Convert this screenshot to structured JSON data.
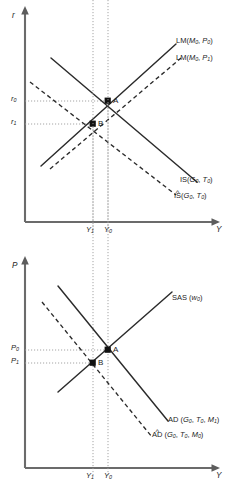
{
  "figure": {
    "panels": [
      "islm",
      "adas"
    ]
  },
  "islm": {
    "axis": {
      "y_label": "r",
      "x_label": "Y"
    },
    "y_ticks": [
      {
        "id": "r0",
        "base": "r",
        "sub": "0",
        "value_y": 101
      },
      {
        "id": "r1",
        "base": "r",
        "sub": "1",
        "value_y": 124
      }
    ],
    "x_ticks": [
      {
        "id": "Y1",
        "base": "Y",
        "sub": "1",
        "value_x": 93
      },
      {
        "id": "Y0",
        "base": "Y",
        "sub": "0",
        "value_x": 108
      }
    ],
    "points": [
      {
        "label": "A",
        "x": 108,
        "y": 101
      },
      {
        "label": "B",
        "x": 93,
        "y": 124
      }
    ],
    "curves": [
      {
        "id": "lm0",
        "label_prefix": "LM",
        "label_args": "(M0, P0)",
        "arg_base_1": "M",
        "arg_sub_1": "0",
        "arg_base_2": "P",
        "arg_sub_2": "0",
        "style": "solid",
        "hat": false
      },
      {
        "id": "lm1",
        "label_prefix": "LM",
        "label_args": "(M0, P1)",
        "arg_base_1": "M",
        "arg_sub_1": "0",
        "arg_base_2": "P",
        "arg_sub_2": "1",
        "style": "dashed",
        "hat": false
      },
      {
        "id": "is0",
        "label_prefix": "IS",
        "label_args": "(G0, T0)",
        "arg_base_1": "G",
        "arg_sub_1": "0",
        "arg_base_2": "T",
        "arg_sub_2": "0",
        "style": "solid",
        "hat": false
      },
      {
        "id": "is_hat",
        "label_prefix": "IS",
        "label_args": "(G0, T0)",
        "arg_base_1": "G",
        "arg_sub_1": "0",
        "arg_base_2": "T",
        "arg_sub_2": "0",
        "style": "dashed",
        "hat": true
      }
    ]
  },
  "adas": {
    "axis": {
      "y_label": "P",
      "x_label": "Y"
    },
    "y_ticks": [
      {
        "id": "P0",
        "base": "P",
        "sub": "0",
        "value_y": 350
      },
      {
        "id": "P1",
        "base": "P",
        "sub": "1",
        "value_y": 363
      }
    ],
    "x_ticks": [
      {
        "id": "Y1",
        "base": "Y",
        "sub": "1",
        "value_x": 93
      },
      {
        "id": "Y0",
        "base": "Y",
        "sub": "0",
        "value_x": 108
      }
    ],
    "points": [
      {
        "label": "A",
        "x": 108,
        "y": 350
      },
      {
        "label": "B",
        "x": 93,
        "y": 363
      }
    ],
    "curves": [
      {
        "id": "sas",
        "label_prefix": "SAS",
        "label_args": "(w0)",
        "arg_base_1": "w",
        "arg_sub_1": "0",
        "style": "solid",
        "hat": false
      },
      {
        "id": "ad1",
        "label_prefix": "AD",
        "label_args": "(G0, T0, M1)",
        "arg_base_1": "G",
        "arg_sub_1": "0",
        "arg_base_2": "T",
        "arg_sub_2": "0",
        "arg_base_3": "M",
        "arg_sub_3": "1",
        "style": "solid",
        "hat": false
      },
      {
        "id": "ad_hat",
        "label_prefix": "AD",
        "label_args": "(G0, T0, M0)",
        "arg_base_1": "G",
        "arg_sub_1": "0",
        "arg_base_2": "T",
        "arg_sub_2": "0",
        "arg_base_3": "M",
        "arg_sub_3": "0",
        "style": "dashed",
        "hat": true
      }
    ]
  },
  "colors": {
    "axis": "#6b6b6b",
    "curve": "#2b2b2b",
    "guide": "#9a9a9a",
    "point": "#111111",
    "background": "#ffffff"
  },
  "glyphs": {
    "hat": "^",
    "open_paren": "(",
    "close_paren": ")",
    "comma": ","
  }
}
